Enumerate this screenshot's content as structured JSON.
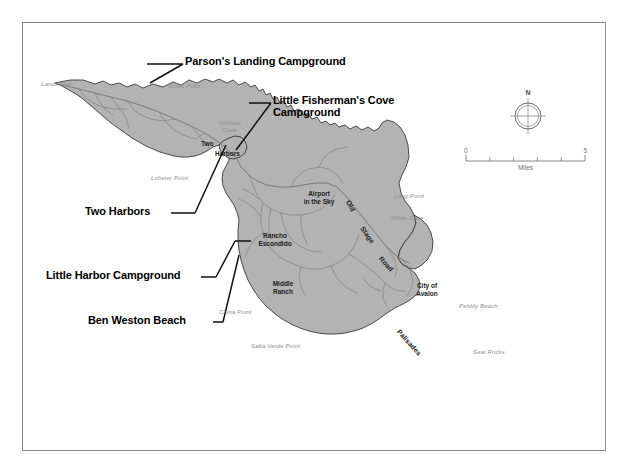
{
  "document": {
    "type": "map",
    "subject": "Santa Catalina Island",
    "frame_border_color": "#8a8a8a",
    "background_color": "#ffffff",
    "landmass_fill_color": "#b3b3b3",
    "landmass_outline_color": "#3a3a3a",
    "road_color": "#5d5d5d"
  },
  "callouts": [
    {
      "id": "parsons-landing",
      "label": "Parson's Landing Campground",
      "lines": [
        "Parson's Landing Campground"
      ]
    },
    {
      "id": "little-fishermans-cove",
      "label": "Little Fisherman's Cove Campground",
      "lines": [
        "Little Fisherman's Cove",
        "Campground"
      ]
    },
    {
      "id": "two-harbors",
      "label": "Two Harbors",
      "lines": [
        "Two Harbors"
      ]
    },
    {
      "id": "little-harbor",
      "label": "Little Harbor Campground",
      "lines": [
        "Little Harbor Campground"
      ]
    },
    {
      "id": "ben-weston-beach",
      "label": "Ben Weston Beach",
      "lines": [
        "Ben Weston Beach"
      ]
    }
  ],
  "place_labels": [
    {
      "id": "lands-end",
      "label": "Lands End",
      "style": "coastal"
    },
    {
      "id": "arrow-point",
      "label": "Arrow Point",
      "style": "coastal"
    },
    {
      "id": "isthmus-cove",
      "label": "Isthmus Cove",
      "style": "coastal",
      "lines": [
        "Isthmus",
        "Cove"
      ]
    },
    {
      "id": "lobster-point",
      "label": "Lobster Point",
      "style": "coastal"
    },
    {
      "id": "two-harbors-town",
      "label": "Two Harbors",
      "style": "settlement",
      "lines": [
        "Two",
        "Harbors"
      ]
    },
    {
      "id": "airport-in-the-sky",
      "label": "Airport in the Sky",
      "style": "settlement",
      "lines": [
        "Airport",
        "in the Sky"
      ]
    },
    {
      "id": "rancho-escondido",
      "label": "Rancho Escondido",
      "style": "settlement",
      "lines": [
        "Rancho",
        "Escondido"
      ]
    },
    {
      "id": "middle-ranch",
      "label": "Middle Ranch",
      "style": "settlement",
      "lines": [
        "Middle",
        "Ranch"
      ]
    },
    {
      "id": "city-of-avalon",
      "label": "City of Avalon",
      "style": "settlement",
      "lines": [
        "City of",
        "Avalon"
      ]
    },
    {
      "id": "long-point",
      "label": "Long Point",
      "style": "coastal"
    },
    {
      "id": "white-cove",
      "label": "White Cove",
      "style": "coastal"
    },
    {
      "id": "pebbly-beach",
      "label": "Pebbly Beach",
      "style": "coastal"
    },
    {
      "id": "seal-rocks",
      "label": "Seal Rocks",
      "style": "coastal"
    },
    {
      "id": "china-point",
      "label": "China Point",
      "style": "coastal"
    },
    {
      "id": "salta-verde-point",
      "label": "Salta Verde Point",
      "style": "coastal"
    }
  ],
  "road_labels": [
    {
      "id": "old-stage-road-old",
      "label": "Old"
    },
    {
      "id": "old-stage-road-stage",
      "label": "Stage"
    },
    {
      "id": "old-stage-road-road",
      "label": "Road"
    },
    {
      "id": "palisades",
      "label": "Palisades"
    }
  ],
  "compass": {
    "north_letter": "N"
  },
  "scale_bar": {
    "min_label": "0",
    "max_label": "5",
    "units_label": "Miles",
    "tick_count": 5
  }
}
